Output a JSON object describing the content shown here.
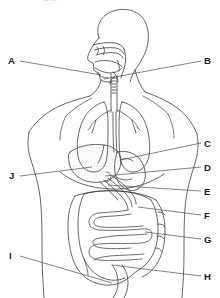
{
  "figure": {
    "title_fragment": "g        y",
    "caption": "",
    "background_color": "#ffffff",
    "stroke_color": "#3c3c3c",
    "label_color": "#1a1a1a",
    "stipple_color": "#b0b0b0",
    "width": 220,
    "height": 298
  },
  "labels": [
    {
      "id": "A",
      "text": "A",
      "x": 8,
      "y": 56
    },
    {
      "id": "B",
      "text": "B",
      "x": 204,
      "y": 56
    },
    {
      "id": "C",
      "text": "C",
      "x": 204,
      "y": 139
    },
    {
      "id": "D",
      "text": "D",
      "x": 204,
      "y": 163
    },
    {
      "id": "E",
      "text": "E",
      "x": 204,
      "y": 187
    },
    {
      "id": "F",
      "text": "F",
      "x": 204,
      "y": 211
    },
    {
      "id": "G",
      "text": "G",
      "x": 204,
      "y": 235
    },
    {
      "id": "H",
      "text": "H",
      "x": 204,
      "y": 272
    },
    {
      "id": "I",
      "text": "I",
      "x": 9,
      "y": 251
    },
    {
      "id": "J",
      "text": "J",
      "x": 9,
      "y": 171
    }
  ],
  "leader_lines": [
    {
      "id": "A",
      "x1": 20,
      "y1": 61,
      "x2": 101,
      "y2": 75
    },
    {
      "id": "B",
      "x1": 201,
      "y1": 61,
      "x2": 104,
      "y2": 79
    },
    {
      "id": "C",
      "x1": 201,
      "y1": 143,
      "x2": 120,
      "y2": 160
    },
    {
      "id": "D",
      "x1": 201,
      "y1": 167,
      "x2": 105,
      "y2": 176
    },
    {
      "id": "E",
      "x1": 201,
      "y1": 191,
      "x2": 108,
      "y2": 185
    },
    {
      "id": "F",
      "x1": 201,
      "y1": 215,
      "x2": 138,
      "y2": 207
    },
    {
      "id": "G",
      "x1": 201,
      "y1": 239,
      "x2": 145,
      "y2": 232
    },
    {
      "id": "H",
      "x1": 201,
      "y1": 276,
      "x2": 112,
      "y2": 265
    },
    {
      "id": "I",
      "x1": 20,
      "y1": 256,
      "x2": 112,
      "y2": 283
    },
    {
      "id": "J",
      "x1": 20,
      "y1": 176,
      "x2": 92,
      "y2": 167
    }
  ]
}
